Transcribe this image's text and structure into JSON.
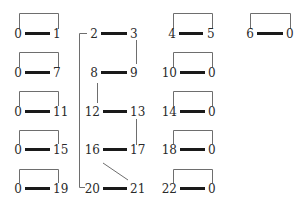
{
  "diagram": {
    "colors": {
      "bar": "#1a1a1a",
      "line": "#6e6e6e",
      "text": "#2a2a2a",
      "background": "#ffffff"
    },
    "pairs": [
      {
        "id": "p0-1",
        "left": "0",
        "right": "1",
        "col": 0,
        "row": 0,
        "bracket": true
      },
      {
        "id": "p0-7",
        "left": "0",
        "right": "7",
        "col": 0,
        "row": 1,
        "bracket": true
      },
      {
        "id": "p0-11",
        "left": "0",
        "right": "11",
        "col": 0,
        "row": 2,
        "bracket": true
      },
      {
        "id": "p0-15",
        "left": "0",
        "right": "15",
        "col": 0,
        "row": 3,
        "bracket": true
      },
      {
        "id": "p0-19",
        "left": "0",
        "right": "19",
        "col": 0,
        "row": 4,
        "bracket": true
      },
      {
        "id": "p2-3",
        "left": "2",
        "right": "3",
        "col": 1,
        "row": 0,
        "bracket": false
      },
      {
        "id": "p8-9",
        "left": "8",
        "right": "9",
        "col": 1,
        "row": 1,
        "bracket": false
      },
      {
        "id": "p12-13",
        "left": "12",
        "right": "13",
        "col": 1,
        "row": 2,
        "bracket": false
      },
      {
        "id": "p16-17",
        "left": "16",
        "right": "17",
        "col": 1,
        "row": 3,
        "bracket": false
      },
      {
        "id": "p20-21",
        "left": "20",
        "right": "21",
        "col": 1,
        "row": 4,
        "bracket": false
      },
      {
        "id": "p4-5",
        "left": "4",
        "right": "5",
        "col": 2,
        "row": 0,
        "bracket": true
      },
      {
        "id": "p10-0",
        "left": "10",
        "right": "0",
        "col": 2,
        "row": 1,
        "bracket": true
      },
      {
        "id": "p14-0",
        "left": "14",
        "right": "0",
        "col": 2,
        "row": 2,
        "bracket": true
      },
      {
        "id": "p18-0",
        "left": "18",
        "right": "0",
        "col": 2,
        "row": 3,
        "bracket": true
      },
      {
        "id": "p22-0",
        "left": "22",
        "right": "0",
        "col": 2,
        "row": 4,
        "bracket": true
      },
      {
        "id": "p6-0",
        "left": "6",
        "right": "0",
        "col": 3,
        "row": 0,
        "bracket": true
      }
    ],
    "connectors": [
      {
        "from": "3",
        "to": "9",
        "type": "vertical"
      },
      {
        "from": "8",
        "to": "12",
        "type": "vertical"
      },
      {
        "from": "13",
        "to": "17",
        "type": "vertical"
      },
      {
        "from": "16",
        "to": "21",
        "type": "diagonal"
      },
      {
        "from": "2",
        "to": "20",
        "type": "left-bracket"
      }
    ]
  }
}
